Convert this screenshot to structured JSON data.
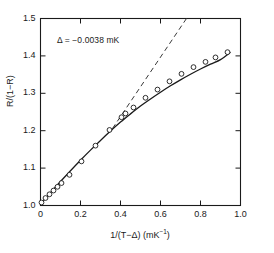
{
  "chart_data": {
    "type": "scatter",
    "title": "",
    "xlabel": "1/(T−Δ) (mK⁻¹)",
    "ylabel": "R/(1−R)",
    "xlim": [
      0,
      1.0
    ],
    "ylim": [
      1.0,
      1.5
    ],
    "xticks": [
      0,
      0.2,
      0.4,
      0.6,
      0.8,
      1.0
    ],
    "xtick_labels": [
      "0",
      "0.2",
      "0.4",
      "0.6",
      "0.8",
      "1.0"
    ],
    "yticks": [
      1.0,
      1.1,
      1.2,
      1.3,
      1.4,
      1.5
    ],
    "ytick_labels": [
      "1.0",
      "1.1",
      "1.2",
      "1.3",
      "1.4",
      "1.5"
    ],
    "grid": false,
    "legend": false,
    "annotations": [
      {
        "text": "Δ = −0.0038 mK",
        "x": 0.16,
        "y": 1.44
      }
    ],
    "series": [
      {
        "name": "measured data",
        "style": "open-circle markers",
        "marker": "o",
        "marker_filled": false,
        "x": [
          0.005,
          0.025,
          0.045,
          0.065,
          0.085,
          0.105,
          0.145,
          0.205,
          0.275,
          0.345,
          0.405,
          0.425,
          0.465,
          0.525,
          0.585,
          0.645,
          0.705,
          0.765,
          0.825,
          0.875,
          0.935
        ],
        "y": [
          1.008,
          1.02,
          1.03,
          1.04,
          1.05,
          1.06,
          1.082,
          1.118,
          1.16,
          1.202,
          1.236,
          1.246,
          1.262,
          1.288,
          1.31,
          1.332,
          1.352,
          1.37,
          1.384,
          1.396,
          1.41
        ]
      },
      {
        "name": "fitted curve",
        "style": "solid line",
        "x": [
          0.0,
          0.05,
          0.1,
          0.15,
          0.2,
          0.25,
          0.3,
          0.35,
          0.4,
          0.45,
          0.5,
          0.55,
          0.6,
          0.65,
          0.7,
          0.75,
          0.8,
          0.85,
          0.9,
          0.95
        ],
        "y": [
          1.004,
          1.034,
          1.064,
          1.093,
          1.121,
          1.148,
          1.174,
          1.199,
          1.223,
          1.245,
          1.266,
          1.285,
          1.303,
          1.32,
          1.336,
          1.351,
          1.365,
          1.378,
          1.39,
          1.41
        ]
      },
      {
        "name": "linear asymptote",
        "style": "dashed line",
        "x": [
          0.36,
          0.73
        ],
        "y": [
          1.206,
          1.5
        ]
      }
    ]
  },
  "axes": {
    "tick_direction": "in",
    "frame": "box",
    "line_color": "#1a1a1a"
  },
  "colors": {
    "data": "#1a1a1a",
    "curve": "#1a1a1a",
    "dashed": "#3a3a3a",
    "background": "#ffffff"
  }
}
